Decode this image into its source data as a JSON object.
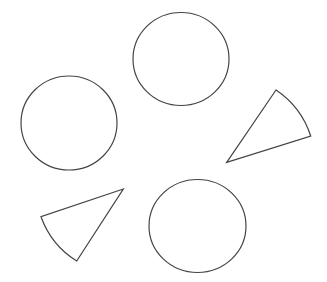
{
  "diagram": {
    "title": "",
    "background": "#ffffff",
    "stroke_color": "#444444",
    "shapes": [
      {
        "id": "circle-top",
        "type": "circle",
        "label": ""
      },
      {
        "id": "circle-left",
        "type": "circle",
        "label": ""
      },
      {
        "id": "circle-bottom",
        "type": "circle",
        "label": ""
      },
      {
        "id": "sector-right",
        "type": "circle-sector",
        "label": ""
      },
      {
        "id": "sector-left",
        "type": "circle-sector",
        "label": ""
      }
    ],
    "counts": {
      "circles": 3,
      "sectors": 2
    }
  }
}
